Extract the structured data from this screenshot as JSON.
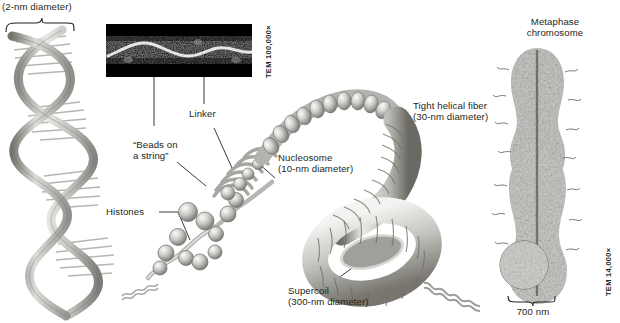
{
  "figure": {
    "title_hidden": "",
    "labels": {
      "dna_diameter": "(2-nm diameter)",
      "tem_top": "TEM 100,000×",
      "beads_on_a_string": "“Beads on\na string”",
      "linker": "Linker",
      "histones": "Histones",
      "nucleosome": "Nucleosome\n(10-nm diameter)",
      "tight_helical_fiber": "Tight helical fiber\n(30-nm diameter)",
      "supercoil": "Supercoil\n(300-nm diameter)",
      "metaphase_chromosome": "Metaphase\nchromosome",
      "scale_bar": "700 nm",
      "tem_right": "TEM 14,000×"
    },
    "colors": {
      "text": "#231f20",
      "background": "#ffffff",
      "leader_line": "#3b3b3b",
      "structure_light": "#f2f1ef",
      "structure_mid": "#b9b7b3",
      "structure_dark": "#6f6d6a",
      "micrograph_bg": "#000000",
      "micrograph_fg": "#ffffff"
    },
    "icons": {
      "brace": "brace-icon",
      "leader": "leader-line-icon",
      "callout": "callout-circle-icon"
    }
  }
}
